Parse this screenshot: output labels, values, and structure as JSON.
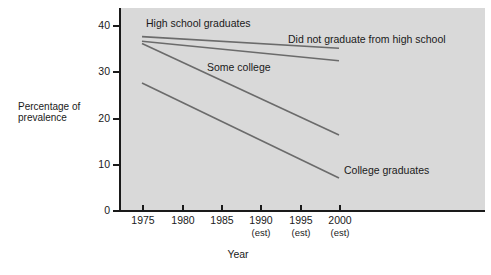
{
  "chart_data": {
    "type": "line",
    "title": "",
    "xlabel": "Year",
    "ylabel": "Percentage of prevalence",
    "xlim": [
      1973.2,
      2001.5
    ],
    "ylim": [
      0,
      43.7
    ],
    "grid": false,
    "legend_position": "inline-labels",
    "x": [
      1975,
      2000
    ],
    "xtick_labels": [
      "1975",
      "1980",
      "1985",
      "1990",
      "1995",
      "2000"
    ],
    "xtick_sublabels": [
      "",
      "",
      "",
      "(est)",
      "(est)",
      "(est)"
    ],
    "ytick_labels": [
      "0",
      "10",
      "20",
      "30",
      "40"
    ],
    "ytick_values": [
      0,
      10,
      20,
      30,
      40
    ],
    "series": [
      {
        "name": "Did not graduate from high school",
        "x": [
          1975,
          2000
        ],
        "values": [
          37.5,
          35.0
        ],
        "label_text": "Did not graduate from high school"
      },
      {
        "name": "High school graduates",
        "x": [
          1975,
          2000
        ],
        "values": [
          36.5,
          32.3
        ],
        "label_text": "High school graduates"
      },
      {
        "name": "Some college",
        "x": [
          1975,
          2000
        ],
        "values": [
          36.0,
          16.3
        ],
        "label_text": "Some college"
      },
      {
        "name": "College graduates",
        "x": [
          1975,
          2000
        ],
        "values": [
          27.5,
          7.0
        ],
        "label_text": "College graduates"
      }
    ]
  },
  "axes": {
    "y_title_line1": "Percentage of",
    "y_title_line2": "prevalence",
    "x_title": "Year",
    "y_ticks": [
      {
        "label": "40"
      },
      {
        "label": "30"
      },
      {
        "label": "20"
      },
      {
        "label": "10"
      },
      {
        "label": "0"
      }
    ],
    "x_ticks": [
      {
        "label": "1975",
        "sub": ""
      },
      {
        "label": "1980",
        "sub": ""
      },
      {
        "label": "1985",
        "sub": ""
      },
      {
        "label": "1990",
        "sub": "(est)"
      },
      {
        "label": "1995",
        "sub": "(est)"
      },
      {
        "label": "2000",
        "sub": "(est)"
      }
    ]
  },
  "annotations": {
    "high_school_graduates": "High school graduates",
    "did_not_graduate": "Did not graduate from high school",
    "some_college": "Some college",
    "college_graduates": "College graduates"
  },
  "colors": {
    "plot_background": "#d9d9d9",
    "page_background": "#ffffff",
    "axis": "#1a1a1a",
    "line": "#6b6b6b",
    "text": "#1a1a1a"
  }
}
